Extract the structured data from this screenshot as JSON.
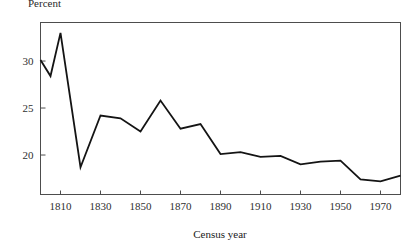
{
  "figure": {
    "y_axis_caption": "Percent",
    "x_axis_title": "Census year"
  },
  "chart_data": {
    "type": "line",
    "title": "",
    "subtitle": "",
    "xlabel": "Census year",
    "ylabel": "Percent",
    "x": [
      1800,
      1805,
      1810,
      1820,
      1830,
      1840,
      1850,
      1860,
      1870,
      1880,
      1890,
      1900,
      1910,
      1920,
      1930,
      1940,
      1950,
      1960,
      1970,
      1980
    ],
    "values": [
      30.1,
      28.4,
      33.0,
      18.7,
      24.2,
      23.9,
      22.5,
      25.8,
      22.8,
      23.3,
      20.1,
      20.3,
      19.8,
      19.9,
      19.0,
      19.3,
      19.4,
      17.4,
      17.2,
      17.8
    ],
    "series": [
      {
        "name": "Percent",
        "values": [
          30.1,
          28.4,
          33.0,
          18.7,
          24.2,
          23.9,
          22.5,
          25.8,
          22.8,
          23.3,
          20.1,
          20.3,
          19.8,
          19.9,
          19.0,
          19.3,
          19.4,
          17.4,
          17.2,
          17.8
        ]
      }
    ],
    "xlim": [
      1800,
      1980
    ],
    "ylim": [
      15.8,
      34.1
    ],
    "xticks": [
      1810,
      1830,
      1850,
      1870,
      1890,
      1910,
      1930,
      1950,
      1970
    ],
    "xtick_labels": [
      "1810",
      "1830",
      "1850",
      "1870",
      "1890",
      "1910",
      "1930",
      "1950",
      "1970"
    ],
    "yticks": [
      20,
      25,
      30
    ],
    "ytick_labels": [
      "20",
      "25",
      "30"
    ],
    "grid": false,
    "legend": false,
    "legend_position": "none",
    "line_color": "#141414",
    "line_width": 1.8,
    "frame_color": "#4d4d4d",
    "background_color": "#ffffff"
  }
}
